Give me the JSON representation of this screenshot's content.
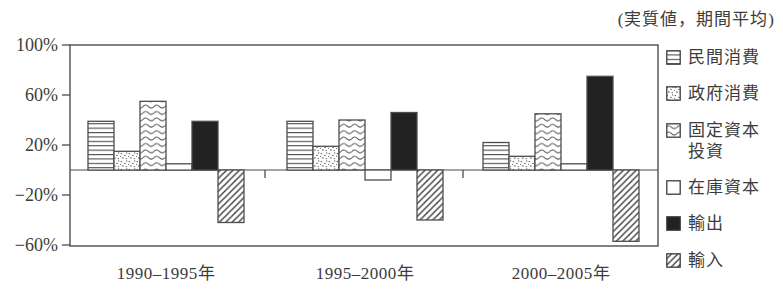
{
  "chart_data": {
    "type": "bar",
    "title": "",
    "subtitle": "(実質値，期間平均)",
    "categories": [
      "1990–1995年",
      "1995–2000年",
      "2000–2005年"
    ],
    "series": [
      {
        "name": "民間消費",
        "key": "private-consumption",
        "pattern": "hlines",
        "values": [
          39,
          39,
          22
        ]
      },
      {
        "name": "政府消費",
        "key": "government-consumption",
        "pattern": "dots",
        "values": [
          15,
          19,
          11
        ]
      },
      {
        "name": "固定資本投資",
        "key": "fixed-capital-investment",
        "pattern": "wave",
        "values": [
          55,
          40,
          45
        ]
      },
      {
        "name": "在庫資本",
        "key": "inventory-capital",
        "pattern": "plain",
        "values": [
          5,
          -8,
          5
        ]
      },
      {
        "name": "輸出",
        "key": "exports",
        "pattern": "solid",
        "values": [
          39,
          46,
          75
        ]
      },
      {
        "name": "輸入",
        "key": "imports",
        "pattern": "diag",
        "values": [
          -42,
          -40,
          -57
        ]
      }
    ],
    "y_axis": {
      "min": -60,
      "max": 100,
      "unit": "%",
      "ticks": [
        {
          "value": 100,
          "label": "100%"
        },
        {
          "value": 60,
          "label": "60%"
        },
        {
          "value": 20,
          "label": "20%"
        },
        {
          "value": -20,
          "label": "−20%"
        },
        {
          "value": -60,
          "label": "−60%"
        }
      ]
    },
    "grid": false,
    "legend_position": "right"
  },
  "legend": {
    "items": [
      {
        "key": "private-consumption",
        "label": "民間消費",
        "pattern": "hlines"
      },
      {
        "key": "government-consumption",
        "label": "政府消費",
        "pattern": "dots"
      },
      {
        "key": "fixed-capital-investment",
        "label": "固定資本\n投資",
        "pattern": "wave"
      },
      {
        "key": "inventory-capital",
        "label": "在庫資本",
        "pattern": "plain"
      },
      {
        "key": "exports",
        "label": "輸出",
        "pattern": "solid"
      },
      {
        "key": "imports",
        "label": "輸入",
        "pattern": "diag"
      }
    ]
  }
}
